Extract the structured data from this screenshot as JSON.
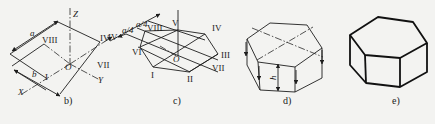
{
  "figure": {
    "panels": [
      {
        "id": "b",
        "caption": "b)",
        "labels": {
          "z_axis": "Z",
          "x_axis": "X",
          "y_axis": "Y",
          "origin": "O",
          "dim_a": "a",
          "dim_b": "b",
          "pt_viii": "VIII",
          "pt_iv": "IV",
          "pt_vii": "VII",
          "pt_i": "I"
        }
      },
      {
        "id": "c",
        "caption": "c)",
        "labels": {
          "dim_a4_1": "a/4",
          "dim_a4_2": "a/4",
          "origin": "O",
          "pt_i": "I",
          "pt_ii": "II",
          "pt_iii": "III",
          "pt_iv": "IV",
          "pt_v": "V",
          "pt_vi": "VI",
          "pt_vii": "VII",
          "pt_viii": "VIII",
          "pt_iv_left": "IV"
        }
      },
      {
        "id": "d",
        "caption": "d)",
        "labels": {
          "height": "h"
        }
      },
      {
        "id": "e",
        "caption": "e)",
        "labels": {}
      }
    ],
    "colors": {
      "ink": "#1e1e1e",
      "paper": "#f3f3f1"
    }
  }
}
